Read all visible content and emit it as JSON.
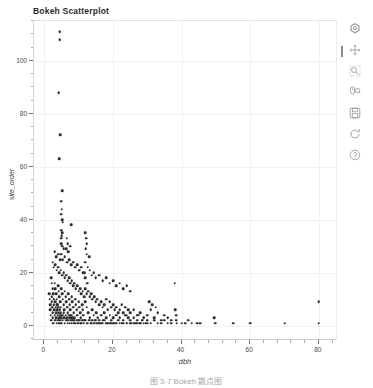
{
  "figure": {
    "title": "Bokeh Scatterplot",
    "caption": "图 3-7 Bokeh 散点图"
  },
  "toolbar": {
    "tools": [
      {
        "name": "bokeh-logo-icon",
        "label": "Bokeh",
        "interactable": false
      },
      {
        "name": "pan-tool-icon",
        "label": "Pan",
        "interactable": true
      },
      {
        "name": "box-zoom-tool-icon",
        "label": "Box Zoom",
        "interactable": true
      },
      {
        "name": "wheel-zoom-tool-icon",
        "label": "Wheel Zoom",
        "interactable": true
      },
      {
        "name": "save-tool-icon",
        "label": "Save",
        "interactable": true
      },
      {
        "name": "reset-tool-icon",
        "label": "Reset",
        "interactable": true
      },
      {
        "name": "help-tool-icon",
        "label": "Help",
        "interactable": true
      }
    ],
    "active_tool": "Pan"
  },
  "chart_data": {
    "type": "scatter",
    "title": "Bokeh Scatterplot",
    "xlabel": "dbh",
    "ylabel": "site_order",
    "xlim": [
      -3,
      85
    ],
    "ylim": [
      -5,
      115
    ],
    "xticks": [
      0,
      20,
      40,
      60,
      80
    ],
    "yticks": [
      0,
      20,
      40,
      60,
      80,
      100
    ],
    "x_minor_interval": 4,
    "y_minor_interval": 5,
    "grid": true,
    "legend": false,
    "marker": "circle",
    "marker_color": "#2f2f2f",
    "marker_size": 2.6,
    "points": [
      [
        4.5,
        111
      ],
      [
        4.5,
        108
      ],
      [
        4.2,
        88
      ],
      [
        4.6,
        72
      ],
      [
        4.4,
        63
      ],
      [
        5.2,
        51
      ],
      [
        5.0,
        47
      ],
      [
        5.1,
        44
      ],
      [
        5.0,
        42
      ],
      [
        5.2,
        40
      ],
      [
        5.4,
        39
      ],
      [
        7.8,
        38
      ],
      [
        4.9,
        36
      ],
      [
        5.3,
        35
      ],
      [
        5.1,
        34
      ],
      [
        5.0,
        33
      ],
      [
        12.0,
        35
      ],
      [
        12.2,
        33
      ],
      [
        12.4,
        31
      ],
      [
        5.0,
        31
      ],
      [
        5.2,
        30
      ],
      [
        5.6,
        29
      ],
      [
        6.4,
        29
      ],
      [
        7.0,
        28
      ],
      [
        12.1,
        29
      ],
      [
        12.3,
        27
      ],
      [
        13.0,
        26
      ],
      [
        3.0,
        28
      ],
      [
        3.4,
        26
      ],
      [
        4.0,
        27
      ],
      [
        4.6,
        25
      ],
      [
        5.0,
        27
      ],
      [
        5.4,
        25
      ],
      [
        6.0,
        26
      ],
      [
        6.6,
        24
      ],
      [
        7.2,
        25
      ],
      [
        7.8,
        23
      ],
      [
        8.4,
        24
      ],
      [
        9.0,
        22
      ],
      [
        9.6,
        23
      ],
      [
        10.2,
        21
      ],
      [
        10.8,
        22
      ],
      [
        11.4,
        20
      ],
      [
        12.0,
        24
      ],
      [
        12.6,
        22
      ],
      [
        13.2,
        21
      ],
      [
        13.8,
        19
      ],
      [
        14.4,
        20
      ],
      [
        15.0,
        18
      ],
      [
        16.0,
        19
      ],
      [
        17.0,
        17
      ],
      [
        18.0,
        18
      ],
      [
        19.0,
        16
      ],
      [
        20.0,
        17
      ],
      [
        21.0,
        15
      ],
      [
        22.0,
        16
      ],
      [
        23.0,
        14
      ],
      [
        24.0,
        15
      ],
      [
        25.0,
        13
      ],
      [
        2.5,
        24
      ],
      [
        2.8,
        22
      ],
      [
        3.2,
        23
      ],
      [
        3.6,
        21
      ],
      [
        4.0,
        22
      ],
      [
        4.4,
        20
      ],
      [
        4.8,
        21
      ],
      [
        5.2,
        19
      ],
      [
        5.6,
        20
      ],
      [
        6.0,
        18
      ],
      [
        6.4,
        19
      ],
      [
        6.8,
        17
      ],
      [
        7.2,
        18
      ],
      [
        7.6,
        16
      ],
      [
        8.0,
        17
      ],
      [
        8.4,
        15
      ],
      [
        8.8,
        16
      ],
      [
        9.2,
        14
      ],
      [
        9.6,
        15
      ],
      [
        10.0,
        13
      ],
      [
        10.4,
        14
      ],
      [
        10.8,
        12
      ],
      [
        11.2,
        13
      ],
      [
        11.6,
        11
      ],
      [
        12.0,
        14
      ],
      [
        12.4,
        12
      ],
      [
        12.8,
        13
      ],
      [
        13.2,
        11
      ],
      [
        13.6,
        12
      ],
      [
        14.0,
        10
      ],
      [
        14.5,
        11
      ],
      [
        15.0,
        9
      ],
      [
        15.5,
        10
      ],
      [
        16.0,
        8
      ],
      [
        16.5,
        9
      ],
      [
        17.0,
        7
      ],
      [
        17.5,
        8
      ],
      [
        18.0,
        10
      ],
      [
        18.5,
        6
      ],
      [
        19.0,
        9
      ],
      [
        19.5,
        7
      ],
      [
        20.0,
        8
      ],
      [
        20.5,
        6
      ],
      [
        21.0,
        7
      ],
      [
        21.5,
        5
      ],
      [
        22.0,
        6
      ],
      [
        22.5,
        8
      ],
      [
        23.0,
        5
      ],
      [
        23.5,
        7
      ],
      [
        24.0,
        4
      ],
      [
        24.5,
        6
      ],
      [
        25.0,
        5
      ],
      [
        26.0,
        6
      ],
      [
        27.0,
        4
      ],
      [
        28.0,
        5
      ],
      [
        29.0,
        3
      ],
      [
        30.0,
        4
      ],
      [
        31.0,
        6
      ],
      [
        32.0,
        3
      ],
      [
        33.0,
        5
      ],
      [
        34.0,
        2
      ],
      [
        35.0,
        4
      ],
      [
        36.0,
        3
      ],
      [
        37.0,
        2
      ],
      [
        2.0,
        18
      ],
      [
        2.2,
        16
      ],
      [
        2.4,
        14
      ],
      [
        2.6,
        12
      ],
      [
        2.8,
        10
      ],
      [
        3.0,
        16
      ],
      [
        3.2,
        14
      ],
      [
        3.4,
        12
      ],
      [
        3.6,
        10
      ],
      [
        3.8,
        8
      ],
      [
        4.0,
        15
      ],
      [
        4.2,
        13
      ],
      [
        4.4,
        11
      ],
      [
        4.6,
        9
      ],
      [
        4.8,
        7
      ],
      [
        5.0,
        14
      ],
      [
        5.2,
        12
      ],
      [
        5.4,
        10
      ],
      [
        5.6,
        8
      ],
      [
        5.8,
        6
      ],
      [
        6.0,
        13
      ],
      [
        6.2,
        11
      ],
      [
        6.4,
        9
      ],
      [
        6.6,
        7
      ],
      [
        6.8,
        5
      ],
      [
        7.0,
        12
      ],
      [
        7.2,
        10
      ],
      [
        7.4,
        8
      ],
      [
        7.6,
        6
      ],
      [
        7.8,
        4
      ],
      [
        8.0,
        11
      ],
      [
        8.2,
        9
      ],
      [
        8.4,
        7
      ],
      [
        8.6,
        5
      ],
      [
        8.8,
        3
      ],
      [
        9.0,
        10
      ],
      [
        9.2,
        8
      ],
      [
        9.4,
        6
      ],
      [
        9.6,
        4
      ],
      [
        9.8,
        2
      ],
      [
        10.0,
        9
      ],
      [
        10.2,
        7
      ],
      [
        10.4,
        5
      ],
      [
        10.6,
        3
      ],
      [
        10.8,
        1
      ],
      [
        11.0,
        8
      ],
      [
        11.2,
        6
      ],
      [
        11.4,
        4
      ],
      [
        11.6,
        2
      ],
      [
        12.0,
        9
      ],
      [
        12.4,
        7
      ],
      [
        12.8,
        5
      ],
      [
        13.2,
        3
      ],
      [
        13.6,
        1
      ],
      [
        14.0,
        6
      ],
      [
        14.4,
        4
      ],
      [
        14.8,
        2
      ],
      [
        15.2,
        5
      ],
      [
        15.6,
        3
      ],
      [
        16.0,
        1
      ],
      [
        16.5,
        4
      ],
      [
        17.0,
        2
      ],
      [
        17.5,
        5
      ],
      [
        18.0,
        3
      ],
      [
        18.5,
        1
      ],
      [
        19.0,
        4
      ],
      [
        19.5,
        2
      ],
      [
        20.0,
        3
      ],
      [
        20.5,
        1
      ],
      [
        21.0,
        4
      ],
      [
        21.5,
        2
      ],
      [
        22.0,
        3
      ],
      [
        22.5,
        1
      ],
      [
        23.0,
        2
      ],
      [
        23.5,
        4
      ],
      [
        24.0,
        1
      ],
      [
        24.5,
        3
      ],
      [
        25.0,
        2
      ],
      [
        25.5,
        1
      ],
      [
        26.0,
        3
      ],
      [
        26.5,
        1
      ],
      [
        27.0,
        2
      ],
      [
        27.5,
        4
      ],
      [
        28.0,
        1
      ],
      [
        28.5,
        2
      ],
      [
        29.0,
        3
      ],
      [
        29.5,
        1
      ],
      [
        30.0,
        2
      ],
      [
        1.5,
        12
      ],
      [
        1.6,
        10
      ],
      [
        1.7,
        8
      ],
      [
        1.8,
        6
      ],
      [
        1.9,
        4
      ],
      [
        2.0,
        2
      ],
      [
        2.1,
        11
      ],
      [
        2.2,
        9
      ],
      [
        2.3,
        7
      ],
      [
        2.4,
        5
      ],
      [
        2.5,
        3
      ],
      [
        2.6,
        1
      ],
      [
        2.7,
        10
      ],
      [
        2.8,
        8
      ],
      [
        2.9,
        6
      ],
      [
        3.0,
        4
      ],
      [
        3.1,
        2
      ],
      [
        3.2,
        9
      ],
      [
        3.3,
        7
      ],
      [
        3.4,
        5
      ],
      [
        3.5,
        3
      ],
      [
        3.6,
        1
      ],
      [
        3.7,
        8
      ],
      [
        3.8,
        6
      ],
      [
        3.9,
        4
      ],
      [
        4.0,
        2
      ],
      [
        4.1,
        7
      ],
      [
        4.2,
        5
      ],
      [
        4.3,
        3
      ],
      [
        4.4,
        1
      ],
      [
        4.5,
        6
      ],
      [
        4.6,
        4
      ],
      [
        4.7,
        2
      ],
      [
        4.8,
        5
      ],
      [
        4.9,
        3
      ],
      [
        5.0,
        1
      ],
      [
        5.2,
        4
      ],
      [
        5.4,
        2
      ],
      [
        5.6,
        5
      ],
      [
        5.8,
        3
      ],
      [
        6.0,
        1
      ],
      [
        6.2,
        4
      ],
      [
        6.4,
        2
      ],
      [
        6.6,
        3
      ],
      [
        6.8,
        1
      ],
      [
        7.0,
        2
      ],
      [
        7.2,
        4
      ],
      [
        7.4,
        1
      ],
      [
        7.6,
        3
      ],
      [
        7.8,
        2
      ],
      [
        8.0,
        1
      ],
      [
        8.2,
        3
      ],
      [
        8.4,
        2
      ],
      [
        8.6,
        1
      ],
      [
        8.8,
        2
      ],
      [
        9.0,
        1
      ],
      [
        9.4,
        2
      ],
      [
        9.8,
        1
      ],
      [
        10.2,
        2
      ],
      [
        10.6,
        1
      ],
      [
        11.0,
        2
      ],
      [
        11.5,
        1
      ],
      [
        12.0,
        2
      ],
      [
        12.5,
        1
      ],
      [
        13.0,
        2
      ],
      [
        13.5,
        1
      ],
      [
        14.0,
        2
      ],
      [
        14.5,
        1
      ],
      [
        15.0,
        2
      ],
      [
        15.5,
        1
      ],
      [
        16.0,
        2
      ],
      [
        16.5,
        1
      ],
      [
        17.0,
        1
      ],
      [
        17.5,
        2
      ],
      [
        18.0,
        1
      ],
      [
        18.5,
        1
      ],
      [
        19.0,
        1
      ],
      [
        19.5,
        1
      ],
      [
        20.0,
        1
      ],
      [
        21.0,
        1
      ],
      [
        22.0,
        1
      ],
      [
        23.0,
        1
      ],
      [
        24.0,
        1
      ],
      [
        25.0,
        1
      ],
      [
        26.0,
        1
      ],
      [
        27.0,
        1
      ],
      [
        28.0,
        1
      ],
      [
        29.0,
        1
      ],
      [
        30.0,
        1
      ],
      [
        31.0,
        1
      ],
      [
        32.0,
        2
      ],
      [
        33.0,
        1
      ],
      [
        34.0,
        1
      ],
      [
        35.0,
        2
      ],
      [
        36.0,
        1
      ],
      [
        37.0,
        1
      ],
      [
        38.0,
        16
      ],
      [
        38.2,
        6
      ],
      [
        38.4,
        4
      ],
      [
        38.5,
        2
      ],
      [
        38.6,
        1
      ],
      [
        40.0,
        1
      ],
      [
        41.0,
        1
      ],
      [
        42.0,
        2
      ],
      [
        43.0,
        1
      ],
      [
        44.5,
        1
      ],
      [
        45.5,
        1
      ],
      [
        49.5,
        3
      ],
      [
        49.6,
        1
      ],
      [
        50.0,
        1
      ],
      [
        55.0,
        1
      ],
      [
        60.0,
        1
      ],
      [
        70.0,
        1
      ],
      [
        80.0,
        9
      ],
      [
        80.0,
        1
      ],
      [
        31.5,
        8
      ],
      [
        32.5,
        7
      ],
      [
        30.5,
        9
      ],
      [
        12.0,
        18
      ],
      [
        12.5,
        16
      ],
      [
        11.8,
        20
      ],
      [
        6.5,
        33
      ],
      [
        6.8,
        31
      ],
      [
        7.5,
        30
      ]
    ]
  }
}
